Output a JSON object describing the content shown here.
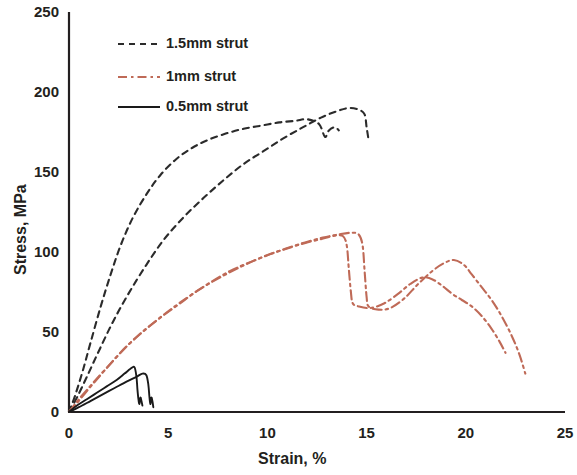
{
  "chart_data": {
    "type": "line",
    "title": "",
    "subtitle": "",
    "xlabel": "Strain, %",
    "ylabel": "Stress, MPa",
    "xlim": [
      0,
      25
    ],
    "ylim": [
      0,
      250
    ],
    "xticks": [
      "0",
      "5",
      "10",
      "15",
      "20",
      "25"
    ],
    "yticks": [
      "0",
      "50",
      "100",
      "150",
      "200",
      "250"
    ],
    "xtick_values": [
      0,
      5,
      10,
      15,
      20,
      25
    ],
    "ytick_values": [
      0,
      50,
      100,
      150,
      200,
      250
    ],
    "grid": false,
    "legend_position": "top-left-inside",
    "colors": {
      "strut_1p5mm": "#2b2b2b",
      "strut_1mm": "#bf6a57",
      "strut_0p5mm": "#1a1a1a",
      "axis": "#231f20",
      "text": "#231f20",
      "background": "#ffffff"
    },
    "legend": [
      {
        "label": "1.5mm strut",
        "color": "#2b2b2b",
        "style": "dashed"
      },
      {
        "label": "1mm strut",
        "color": "#bf6a57",
        "style": "dash-dot"
      },
      {
        "label": "0.5mm strut",
        "color": "#1a1a1a",
        "style": "solid"
      }
    ],
    "series": [
      {
        "name": "1.5mm strut",
        "replicate": 1,
        "color": "#2b2b2b",
        "style": "dashed",
        "points": [
          [
            0.0,
            0
          ],
          [
            0.3,
            10
          ],
          [
            0.7,
            26
          ],
          [
            1.1,
            44
          ],
          [
            1.6,
            66
          ],
          [
            2.1,
            86
          ],
          [
            2.6,
            104
          ],
          [
            3.2,
            121
          ],
          [
            3.9,
            136
          ],
          [
            4.6,
            148
          ],
          [
            5.4,
            158
          ],
          [
            6.2,
            165
          ],
          [
            7.0,
            170
          ],
          [
            7.9,
            174
          ],
          [
            8.8,
            177
          ],
          [
            9.7,
            179
          ],
          [
            10.6,
            181
          ],
          [
            11.4,
            182
          ],
          [
            12.0,
            183
          ],
          [
            12.6,
            180
          ],
          [
            12.9,
            172
          ],
          [
            13.1,
            176
          ],
          [
            13.4,
            178
          ],
          [
            13.6,
            176
          ]
        ]
      },
      {
        "name": "1.5mm strut",
        "replicate": 2,
        "color": "#2b2b2b",
        "style": "dashed",
        "points": [
          [
            0.0,
            0
          ],
          [
            0.4,
            9
          ],
          [
            0.9,
            22
          ],
          [
            1.5,
            38
          ],
          [
            2.2,
            56
          ],
          [
            3.0,
            74
          ],
          [
            3.9,
            92
          ],
          [
            4.8,
            108
          ],
          [
            5.8,
            122
          ],
          [
            6.8,
            134
          ],
          [
            7.8,
            145
          ],
          [
            8.8,
            155
          ],
          [
            9.8,
            163
          ],
          [
            10.8,
            171
          ],
          [
            11.8,
            178
          ],
          [
            12.7,
            184
          ],
          [
            13.5,
            188
          ],
          [
            14.1,
            190
          ],
          [
            14.6,
            189
          ],
          [
            14.9,
            186
          ],
          [
            15.0,
            178
          ],
          [
            15.1,
            170
          ]
        ]
      },
      {
        "name": "1mm strut",
        "replicate": 1,
        "color": "#bf6a57",
        "style": "dash-dot",
        "points": [
          [
            0.0,
            0
          ],
          [
            0.5,
            7
          ],
          [
            1.1,
            16
          ],
          [
            1.8,
            26
          ],
          [
            2.6,
            37
          ],
          [
            3.5,
            48
          ],
          [
            4.5,
            58
          ],
          [
            5.5,
            67
          ],
          [
            6.5,
            76
          ],
          [
            7.6,
            84
          ],
          [
            8.7,
            91
          ],
          [
            9.8,
            97
          ],
          [
            10.9,
            102
          ],
          [
            11.9,
            106
          ],
          [
            12.8,
            109
          ],
          [
            13.6,
            111
          ],
          [
            14.2,
            112
          ],
          [
            14.6,
            111
          ],
          [
            14.8,
            104
          ],
          [
            14.9,
            88
          ],
          [
            15.0,
            72
          ],
          [
            15.1,
            66
          ],
          [
            15.6,
            64
          ],
          [
            16.2,
            65
          ],
          [
            16.9,
            71
          ],
          [
            17.6,
            80
          ],
          [
            18.3,
            88
          ],
          [
            18.9,
            93
          ],
          [
            19.4,
            95
          ],
          [
            19.9,
            92
          ],
          [
            20.3,
            86
          ],
          [
            20.8,
            78
          ],
          [
            21.3,
            70
          ],
          [
            21.8,
            60
          ],
          [
            22.3,
            48
          ],
          [
            22.7,
            36
          ],
          [
            23.0,
            24
          ]
        ]
      },
      {
        "name": "1mm strut",
        "replicate": 2,
        "color": "#bf6a57",
        "style": "dash-dot",
        "points": [
          [
            0.0,
            0
          ],
          [
            0.5,
            8
          ],
          [
            1.2,
            18
          ],
          [
            2.0,
            29
          ],
          [
            2.9,
            41
          ],
          [
            3.9,
            52
          ],
          [
            4.9,
            62
          ],
          [
            5.9,
            71
          ],
          [
            7.0,
            80
          ],
          [
            8.1,
            88
          ],
          [
            9.2,
            94
          ],
          [
            10.2,
            99
          ],
          [
            11.2,
            103
          ],
          [
            12.0,
            106
          ],
          [
            12.7,
            108
          ],
          [
            13.3,
            110
          ],
          [
            13.8,
            110
          ],
          [
            14.0,
            104
          ],
          [
            14.1,
            90
          ],
          [
            14.2,
            76
          ],
          [
            14.3,
            68
          ],
          [
            14.6,
            66
          ],
          [
            15.2,
            65
          ],
          [
            15.9,
            68
          ],
          [
            16.6,
            74
          ],
          [
            17.2,
            80
          ],
          [
            17.8,
            84
          ],
          [
            18.3,
            83
          ],
          [
            18.8,
            79
          ],
          [
            19.3,
            74
          ],
          [
            19.8,
            70
          ],
          [
            20.3,
            66
          ],
          [
            20.8,
            60
          ],
          [
            21.3,
            52
          ],
          [
            21.7,
            44
          ],
          [
            22.0,
            37
          ]
        ]
      },
      {
        "name": "0.5mm strut",
        "replicate": 1,
        "color": "#1a1a1a",
        "style": "solid",
        "points": [
          [
            0.0,
            0
          ],
          [
            0.4,
            4
          ],
          [
            0.9,
            8
          ],
          [
            1.4,
            12
          ],
          [
            1.9,
            16
          ],
          [
            2.4,
            20
          ],
          [
            2.8,
            24
          ],
          [
            3.1,
            27
          ],
          [
            3.3,
            28
          ],
          [
            3.4,
            22
          ],
          [
            3.45,
            14
          ],
          [
            3.5,
            8
          ],
          [
            3.55,
            5
          ],
          [
            3.6,
            9
          ],
          [
            3.65,
            7
          ],
          [
            3.7,
            4
          ]
        ]
      },
      {
        "name": "0.5mm strut",
        "replicate": 2,
        "color": "#1a1a1a",
        "style": "solid",
        "points": [
          [
            0.0,
            0
          ],
          [
            0.5,
            3
          ],
          [
            1.1,
            7
          ],
          [
            1.7,
            11
          ],
          [
            2.3,
            15
          ],
          [
            2.9,
            19
          ],
          [
            3.4,
            22
          ],
          [
            3.7,
            24
          ],
          [
            3.9,
            23
          ],
          [
            4.0,
            17
          ],
          [
            4.05,
            10
          ],
          [
            4.1,
            5
          ],
          [
            4.15,
            9
          ],
          [
            4.2,
            7
          ],
          [
            4.25,
            3
          ]
        ]
      }
    ]
  }
}
